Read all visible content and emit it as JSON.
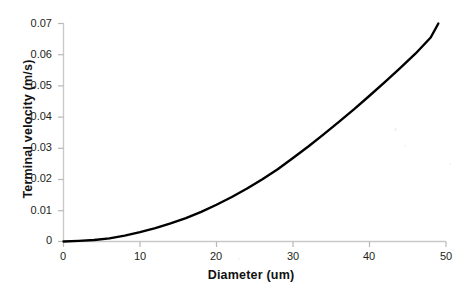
{
  "chart_data": {
    "type": "line",
    "title": "",
    "xlabel": "Diameter (um)",
    "ylabel": "Terminal velocity (m/s)",
    "xlim": [
      0,
      50
    ],
    "ylim": [
      0,
      0.07
    ],
    "xticks": [
      "0",
      "10",
      "20",
      "30",
      "40",
      "50"
    ],
    "xtick_values": [
      0,
      10,
      20,
      30,
      40,
      50
    ],
    "yticks": [
      "0",
      "0.01",
      "0.02",
      "0.03",
      "0.04",
      "0.05",
      "0.06",
      "0.07"
    ],
    "ytick_values": [
      0,
      0.01,
      0.02,
      0.03,
      0.04,
      0.05,
      0.06,
      0.07
    ],
    "grid": false,
    "legend": false,
    "series": [
      {
        "name": "Terminal velocity",
        "color": "#000000",
        "linewidth": 2.4,
        "x": [
          0,
          2,
          4,
          6,
          8,
          10,
          12,
          14,
          16,
          18,
          20,
          22,
          24,
          26,
          28,
          30,
          32,
          34,
          36,
          38,
          40,
          42,
          44,
          46,
          48,
          49
        ],
        "y": [
          0.0,
          0.0002,
          0.0005,
          0.001,
          0.0019,
          0.003,
          0.0043,
          0.0058,
          0.0075,
          0.0095,
          0.0118,
          0.0143,
          0.017,
          0.02,
          0.0232,
          0.0268,
          0.0305,
          0.0344,
          0.0384,
          0.0425,
          0.0468,
          0.0512,
          0.0557,
          0.0603,
          0.0655,
          0.07
        ]
      }
    ]
  },
  "axes": {
    "axis_color": "#c9c9c9",
    "tick_color": "#b0b0b0",
    "label_color": "#231f20",
    "background": "#ffffff"
  }
}
